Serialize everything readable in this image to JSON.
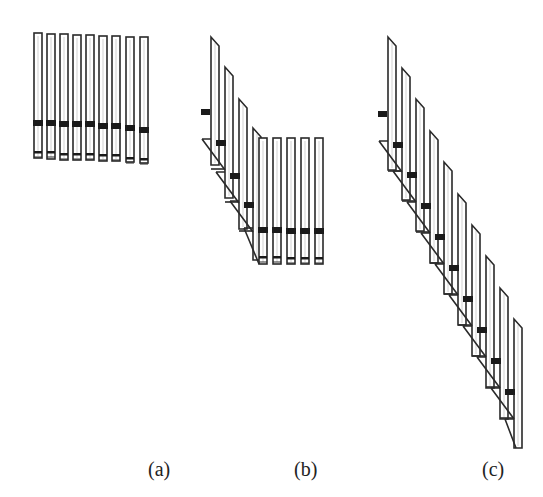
{
  "figure": {
    "stroke_color": "#2a2a2a",
    "band_color": "#1a1a1a",
    "background": "#ffffff"
  },
  "panels": [
    {
      "id": "a",
      "label": "(a)",
      "description": "Nine upright tubes aligned, each with a thick band and a lower thin band",
      "tubes": [
        {
          "x": 34,
          "top": 33,
          "bottom": 158,
          "band_y": 120,
          "low_y": 151
        },
        {
          "x": 47,
          "top": 34,
          "bottom": 159,
          "band_y": 120,
          "low_y": 151
        },
        {
          "x": 60,
          "top": 34,
          "bottom": 160,
          "band_y": 121,
          "low_y": 153
        },
        {
          "x": 73,
          "top": 35,
          "bottom": 160,
          "band_y": 121,
          "low_y": 153
        },
        {
          "x": 86,
          "top": 35,
          "bottom": 160,
          "band_y": 121,
          "low_y": 153
        },
        {
          "x": 99,
          "top": 36,
          "bottom": 161,
          "band_y": 123,
          "low_y": 154
        },
        {
          "x": 112,
          "top": 36,
          "bottom": 161,
          "band_y": 123,
          "low_y": 154
        },
        {
          "x": 126,
          "top": 37,
          "bottom": 162,
          "band_y": 125,
          "low_y": 157
        },
        {
          "x": 140,
          "top": 37,
          "bottom": 163,
          "band_y": 127,
          "low_y": 158
        }
      ]
    },
    {
      "id": "b",
      "label": "(b)",
      "description": "Four slanted staircase tubes followed by five upright aligned tubes",
      "slanted": [
        {
          "x": 211,
          "top": 37,
          "bottom": 165,
          "band_y": 139
        },
        {
          "x": 225,
          "top": 67,
          "bottom": 198,
          "band_y": 172
        },
        {
          "x": 239,
          "top": 99,
          "bottom": 229,
          "band_y": 201
        },
        {
          "x": 253,
          "top": 128,
          "bottom": 260,
          "band_y": 228
        }
      ],
      "upright": [
        {
          "x": 259,
          "top": 138,
          "bottom": 264,
          "band_y": 227,
          "low_y": 256
        },
        {
          "x": 273,
          "top": 138,
          "bottom": 264,
          "band_y": 227,
          "low_y": 256
        },
        {
          "x": 287,
          "top": 138,
          "bottom": 264,
          "band_y": 228,
          "low_y": 257
        },
        {
          "x": 301,
          "top": 138,
          "bottom": 264,
          "band_y": 228,
          "low_y": 257
        },
        {
          "x": 315,
          "top": 138,
          "bottom": 264,
          "band_y": 228,
          "low_y": 257
        }
      ],
      "lead_band": {
        "x": 201,
        "y": 109
      }
    },
    {
      "id": "c",
      "label": "(c)",
      "description": "Nine slanted tubes forming a descending staircase",
      "slanted": [
        {
          "x": 388,
          "top": 37,
          "bottom": 170,
          "band_y": 141
        },
        {
          "x": 402,
          "top": 68,
          "bottom": 200,
          "band_y": 171
        },
        {
          "x": 416,
          "top": 99,
          "bottom": 231,
          "band_y": 202
        },
        {
          "x": 430,
          "top": 131,
          "bottom": 263,
          "band_y": 233
        },
        {
          "x": 444,
          "top": 162,
          "bottom": 294,
          "band_y": 264
        },
        {
          "x": 458,
          "top": 194,
          "bottom": 325,
          "band_y": 295
        },
        {
          "x": 472,
          "top": 225,
          "bottom": 356,
          "band_y": 326
        },
        {
          "x": 486,
          "top": 256,
          "bottom": 388,
          "band_y": 357
        },
        {
          "x": 500,
          "top": 288,
          "bottom": 419,
          "band_y": 388
        },
        {
          "x": 514,
          "top": 319,
          "bottom": 448,
          "band_y": 0
        }
      ],
      "lead_band": {
        "x": 378,
        "y": 111
      }
    }
  ]
}
